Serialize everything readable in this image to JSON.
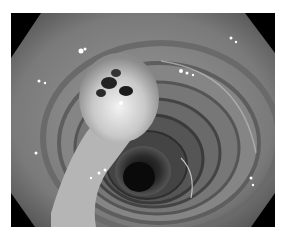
{
  "image": {
    "description": "Grayscale endoscopic view of a bowel lumen with concentric circular folds and a pedunculated polyp on the left wall",
    "colors": {
      "background": "#ffffff",
      "border": "#000000",
      "mucosa": "#8a8a8a",
      "lumen": "#1a1a1a",
      "polyp": "#d8d8d8",
      "highlight": "#ffffff"
    }
  }
}
